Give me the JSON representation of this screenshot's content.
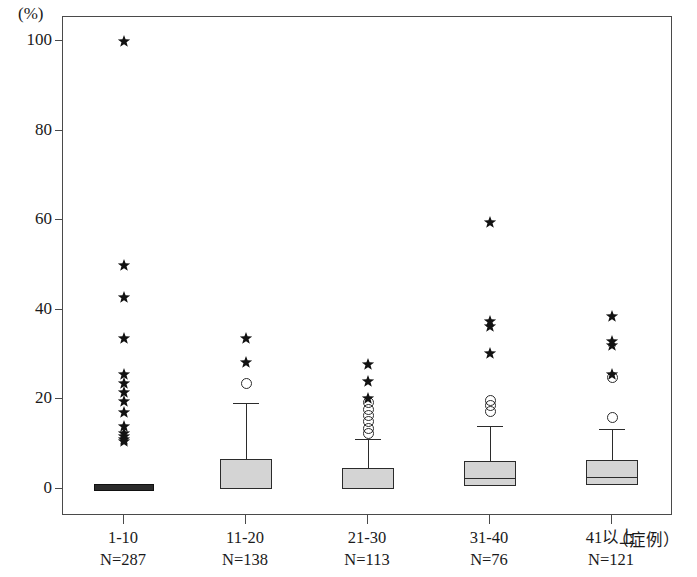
{
  "chart_data": {
    "type": "box",
    "title": "",
    "xlabel": "（症例）",
    "ylabel": "(%)",
    "ylim": [
      -2,
      106
    ],
    "yticks": [
      0,
      20,
      40,
      60,
      80,
      100
    ],
    "ytick_labels": [
      "0",
      "20",
      "40",
      "60",
      "80",
      "100"
    ],
    "grid": false,
    "legend": "none",
    "categories": [
      "1-10",
      "11-20",
      "21-30",
      "31-40",
      "41以上"
    ],
    "category_counts": [
      "N=287",
      "N=138",
      "N=113",
      "N=76",
      "N=121"
    ],
    "n_values": [
      287,
      138,
      113,
      76,
      121
    ],
    "boxes": [
      {
        "category": "1-10",
        "count": 287,
        "q1": 0,
        "median": 0,
        "q3": 0.6,
        "whisker_low": 0,
        "whisker_high": 0.6,
        "outliers_circle": [],
        "outliers_star": [
          100,
          50,
          42.7,
          33.5,
          25.5,
          23.5,
          21.5,
          19.5,
          17,
          14,
          12.5,
          11.8,
          11,
          10.6
        ]
      },
      {
        "category": "11-20",
        "count": 138,
        "q1": 0,
        "median": 0.5,
        "q3": 6.8,
        "whisker_low": 0,
        "whisker_high": 19.2,
        "outliers_circle": [
          23.5
        ],
        "outliers_star": [
          33.5,
          28.2
        ]
      },
      {
        "category": "21-30",
        "count": 113,
        "q1": 0,
        "median": 0.4,
        "q3": 4.6,
        "whisker_low": 0,
        "whisker_high": 11.2,
        "outliers_circle": [
          19.3,
          17.8,
          16.3,
          15.0,
          13.6,
          12.3
        ],
        "outliers_star": [
          27.7,
          23.9,
          20.2
        ]
      },
      {
        "category": "31-40",
        "count": 76,
        "q1": 0.6,
        "median": 2.4,
        "q3": 6.2,
        "whisker_low": 0.6,
        "whisker_high": 14.0,
        "outliers_circle": [
          19.8,
          18.6,
          17.2
        ],
        "outliers_star": [
          59.5,
          37.5,
          36.3,
          30.2
        ]
      },
      {
        "category": "41以上",
        "count": 121,
        "q1": 1.0,
        "median": 2.6,
        "q3": 6.5,
        "whisker_low": 1.0,
        "whisker_high": 13.5,
        "outliers_circle": [
          16.0,
          25.0
        ],
        "outliers_star": [
          38.5,
          33.0,
          32.0,
          25.5
        ]
      }
    ]
  },
  "axis": {
    "unit_label": "(%)",
    "x_unit_label": "（症例）"
  }
}
